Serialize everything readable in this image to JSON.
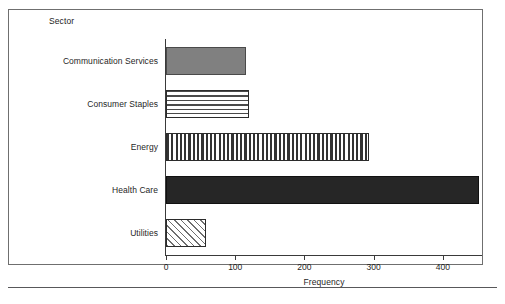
{
  "chart_data": {
    "type": "bar",
    "orientation": "horizontal",
    "title": "",
    "categories": [
      "Communication Services",
      "Consumer Staples",
      "Energy",
      "Health Care",
      "Utilities"
    ],
    "values": [
      115,
      120,
      293,
      452,
      58
    ],
    "xlabel": "Frequency",
    "ylabel": "Sector",
    "xlim": [
      0,
      455
    ],
    "xticks": [
      0,
      100,
      200,
      300,
      400
    ],
    "xtick_labels": [
      "0",
      "100",
      "200",
      "300",
      "400"
    ],
    "grid": false,
    "legend": false,
    "bar_styles": [
      {
        "category": "Communication Services",
        "fill": "solid-gray",
        "color": "#808080"
      },
      {
        "category": "Consumer Staples",
        "fill": "horizontal-stripes",
        "color": "#4a4a4a"
      },
      {
        "category": "Energy",
        "fill": "vertical-stripes",
        "color": "#333333"
      },
      {
        "category": "Health Care",
        "fill": "solid-black",
        "color": "#262626"
      },
      {
        "category": "Utilities",
        "fill": "diagonal-hatch",
        "color": "#6e6e6e"
      }
    ]
  },
  "axes": {
    "y_axis_title": "Sector",
    "x_axis_title": "Frequency"
  }
}
